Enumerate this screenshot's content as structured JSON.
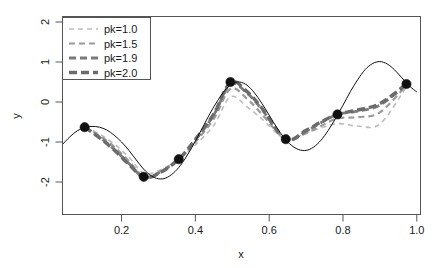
{
  "figure": {
    "width": 432,
    "height": 268,
    "background": "#ffffff"
  },
  "axes": {
    "x_title": "x",
    "y_title": "y",
    "x_ticks": [
      "0.2",
      "0.4",
      "0.6",
      "0.8",
      "1.0"
    ],
    "y_ticks": [
      "2",
      "1",
      "0",
      "-1",
      "-2"
    ],
    "xlim": [
      0.04,
      1.01
    ],
    "ylim": [
      -2.55,
      2.2
    ]
  },
  "legend": {
    "position": "top-left",
    "entries": [
      {
        "label": "pk=1.0",
        "color": "#bdbdbd",
        "width": 1.6,
        "dash": "5,4"
      },
      {
        "label": "pk=1.5",
        "color": "#9a9a9a",
        "width": 2.2,
        "dash": "6,4"
      },
      {
        "label": "pk=1.9",
        "color": "#7a7a7a",
        "width": 2.8,
        "dash": "7,4"
      },
      {
        "label": "pk=2.0",
        "color": "#6b6b6b",
        "width": 3.4,
        "dash": "8,4"
      }
    ]
  },
  "chart_data": {
    "type": "line",
    "title": "",
    "xlabel": "x",
    "ylabel": "y",
    "xlim": [
      0.04,
      1.01
    ],
    "ylim": [
      -2.55,
      2.2
    ],
    "grid": false,
    "legend_position": "top-left",
    "true_curve": {
      "name": "true function",
      "style": "solid",
      "color": "#111111",
      "x": [
        0.04,
        0.06,
        0.08,
        0.1,
        0.12,
        0.14,
        0.16,
        0.18,
        0.2,
        0.22,
        0.24,
        0.26,
        0.28,
        0.3,
        0.32,
        0.34,
        0.36,
        0.38,
        0.4,
        0.42,
        0.44,
        0.46,
        0.48,
        0.5,
        0.52,
        0.54,
        0.56,
        0.58,
        0.6,
        0.62,
        0.64,
        0.66,
        0.68,
        0.7,
        0.72,
        0.74,
        0.76,
        0.78,
        0.8,
        0.82,
        0.84,
        0.86,
        0.88,
        0.9,
        0.92,
        0.94,
        0.96,
        0.98,
        1.0
      ],
      "y": [
        -1.06,
        -0.87,
        -0.72,
        -0.64,
        -0.61,
        -0.63,
        -0.7,
        -0.83,
        -1.0,
        -1.21,
        -1.45,
        -1.68,
        -1.84,
        -1.92,
        -1.9,
        -1.78,
        -1.58,
        -1.3,
        -0.98,
        -0.63,
        -0.28,
        0.03,
        0.29,
        0.46,
        0.5,
        0.42,
        0.23,
        -0.03,
        -0.33,
        -0.63,
        -0.89,
        -1.08,
        -1.19,
        -1.21,
        -1.13,
        -0.96,
        -0.71,
        -0.41,
        -0.08,
        0.26,
        0.56,
        0.81,
        0.96,
        1.01,
        0.95,
        0.8,
        0.6,
        0.4,
        0.25
      ]
    },
    "knots": {
      "name": "observed knots",
      "marker": "filled-circle",
      "color": "#111111",
      "x": [
        0.1,
        0.26,
        0.355,
        0.495,
        0.645,
        0.785,
        0.972
      ],
      "y": [
        -0.63,
        -1.87,
        -1.43,
        0.5,
        -0.93,
        -0.31,
        0.45
      ]
    },
    "series": [
      {
        "name": "pk=1.0",
        "style": "dashed",
        "color": "#bdbdbd",
        "linewidth": 1.6,
        "x": [
          0.1,
          0.14,
          0.18,
          0.22,
          0.26,
          0.3,
          0.355,
          0.4,
          0.45,
          0.495,
          0.54,
          0.58,
          0.645,
          0.7,
          0.74,
          0.785,
          0.84,
          0.9,
          0.972
        ],
        "y": [
          -0.63,
          -0.8,
          -1.05,
          -1.38,
          -1.78,
          -1.72,
          -1.43,
          -1.07,
          -0.58,
          0.13,
          -0.12,
          -0.42,
          -0.93,
          -0.77,
          -0.65,
          -0.54,
          -0.6,
          -0.55,
          0.38
        ]
      },
      {
        "name": "pk=1.5",
        "style": "dashed",
        "color": "#9a9a9a",
        "linewidth": 2.2,
        "x": [
          0.1,
          0.14,
          0.18,
          0.22,
          0.26,
          0.3,
          0.355,
          0.4,
          0.45,
          0.495,
          0.54,
          0.58,
          0.645,
          0.7,
          0.74,
          0.785,
          0.84,
          0.9,
          0.972
        ],
        "y": [
          -0.63,
          -0.84,
          -1.12,
          -1.48,
          -1.86,
          -1.76,
          -1.43,
          -1.0,
          -0.42,
          0.33,
          0.08,
          -0.3,
          -0.93,
          -0.78,
          -0.6,
          -0.41,
          -0.38,
          -0.26,
          0.42
        ]
      },
      {
        "name": "pk=1.9",
        "style": "dashed",
        "color": "#7a7a7a",
        "linewidth": 2.8,
        "x": [
          0.1,
          0.14,
          0.18,
          0.22,
          0.26,
          0.3,
          0.355,
          0.4,
          0.45,
          0.495,
          0.54,
          0.58,
          0.645,
          0.7,
          0.74,
          0.785,
          0.84,
          0.9,
          0.972
        ],
        "y": [
          -0.63,
          -0.88,
          -1.18,
          -1.54,
          -1.88,
          -1.78,
          -1.43,
          -0.95,
          -0.32,
          0.45,
          0.22,
          -0.18,
          -0.93,
          -0.73,
          -0.52,
          -0.31,
          -0.23,
          -0.08,
          0.44
        ]
      },
      {
        "name": "pk=2.0",
        "style": "dashed",
        "color": "#6b6b6b",
        "linewidth": 3.4,
        "x": [
          0.1,
          0.14,
          0.18,
          0.22,
          0.26,
          0.3,
          0.355,
          0.4,
          0.45,
          0.495,
          0.54,
          0.58,
          0.645,
          0.7,
          0.74,
          0.785,
          0.84,
          0.9,
          0.972
        ],
        "y": [
          -0.63,
          -0.89,
          -1.2,
          -1.56,
          -1.88,
          -1.79,
          -1.43,
          -0.93,
          -0.3,
          0.49,
          0.26,
          -0.15,
          -0.93,
          -0.71,
          -0.5,
          -0.31,
          -0.2,
          -0.04,
          0.45
        ]
      }
    ]
  }
}
